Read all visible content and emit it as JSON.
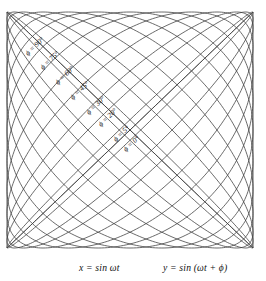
{
  "figure": {
    "name": "lissajous-phase-ellipses",
    "axes": {
      "x_caption": "x = sin ωt",
      "y_caption": "y = sin (ωt + ϕ)"
    },
    "labels": [
      {
        "id": "phi-90",
        "text": "ϕ = 90°",
        "phi": 90,
        "x": 28,
        "y": 56,
        "rotate": -44
      },
      {
        "id": "phi-75",
        "text": "ϕ = 75°",
        "phi": 75,
        "x": 43,
        "y": 70,
        "rotate": -44
      },
      {
        "id": "phi-60",
        "text": "ϕ = 60°",
        "phi": 60,
        "x": 58,
        "y": 85,
        "rotate": -44
      },
      {
        "id": "phi-45",
        "text": "ϕ = 45°",
        "phi": 45,
        "x": 73,
        "y": 100,
        "rotate": -44
      },
      {
        "id": "phi-30",
        "text": "ϕ = 30°",
        "phi": 30,
        "x": 89,
        "y": 115,
        "rotate": -44
      },
      {
        "id": "phi-20",
        "text": "ϕ = 20°",
        "phi": 20,
        "x": 101,
        "y": 127,
        "rotate": -44
      },
      {
        "id": "phi-5",
        "text": "ϕ = 5°",
        "phi": 5,
        "x": 116,
        "y": 142,
        "rotate": -44
      },
      {
        "id": "phi-0",
        "text": "ϕ = 0°",
        "phi": 0,
        "x": 126,
        "y": 152,
        "rotate": -44
      }
    ],
    "colors": {
      "curve_stroke": "#3a3a3a",
      "text": "#111111",
      "background": "#ffffff"
    }
  },
  "chart_data": {
    "type": "line",
    "title": "",
    "xlabel": "x = sin ωt",
    "ylabel": "y = sin (ωt + ϕ)",
    "xlim": [
      -1,
      1
    ],
    "ylim": [
      -1,
      1
    ],
    "grid": false,
    "legend_position": "inline-along-curves",
    "parametric": {
      "x": "sin(ωt)",
      "y": "sin(ωt + ϕ)",
      "t_range_deg": [
        0,
        360
      ]
    },
    "series": [
      {
        "name": "ϕ = 0°",
        "phi_deg": 0
      },
      {
        "name": "ϕ = 5°",
        "phi_deg": 5
      },
      {
        "name": "ϕ = 20°",
        "phi_deg": 20
      },
      {
        "name": "ϕ = 30°",
        "phi_deg": 30
      },
      {
        "name": "ϕ = 45°",
        "phi_deg": 45
      },
      {
        "name": "ϕ = 60°",
        "phi_deg": 60
      },
      {
        "name": "ϕ = 75°",
        "phi_deg": 75
      },
      {
        "name": "ϕ = 90°",
        "phi_deg": 90
      },
      {
        "name": "ϕ = 105°",
        "phi_deg": 105
      },
      {
        "name": "ϕ = 120°",
        "phi_deg": 120
      },
      {
        "name": "ϕ = 135°",
        "phi_deg": 135
      },
      {
        "name": "ϕ = 150°",
        "phi_deg": 150
      },
      {
        "name": "ϕ = 160°",
        "phi_deg": 160
      },
      {
        "name": "ϕ = 175°",
        "phi_deg": 175
      },
      {
        "name": "ϕ = 180°",
        "phi_deg": 180
      }
    ]
  }
}
